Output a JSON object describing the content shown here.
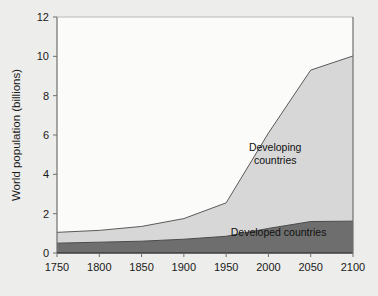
{
  "chart_data": {
    "type": "area",
    "title": "",
    "subtitle": "",
    "xlabel": "",
    "ylabel": "World population (billions)",
    "x": [
      1750,
      1800,
      1850,
      1900,
      1950,
      2000,
      2050,
      2100
    ],
    "xticklabels": [
      "1750",
      "1800",
      "1850",
      "1900",
      "1950",
      "2000",
      "2050",
      "2100"
    ],
    "yticklabels": [
      "0",
      "2",
      "4",
      "6",
      "8",
      "10",
      "12"
    ],
    "yticks": [
      0,
      2,
      4,
      6,
      8,
      10,
      12
    ],
    "xlim": [
      1750,
      2100
    ],
    "ylim": [
      0,
      12
    ],
    "grid": false,
    "stacked": true,
    "legend_position": "inline-annotations",
    "series": [
      {
        "name": "Developed countries",
        "color": "#6e6e6e",
        "values": [
          0.5,
          0.55,
          0.6,
          0.7,
          0.85,
          1.25,
          1.6,
          1.62
        ]
      },
      {
        "name": "Developing countries",
        "color": "#d7d7d7",
        "values": [
          0.55,
          0.6,
          0.75,
          1.05,
          1.7,
          4.85,
          7.7,
          8.4
        ]
      }
    ],
    "totals": [
      1.05,
      1.15,
      1.35,
      1.75,
      2.55,
      6.1,
      9.3,
      10.0
    ],
    "annotations": [
      {
        "name": "developing-label",
        "lines": [
          "Developing",
          "countries"
        ],
        "x": 2008,
        "y": 5.2
      },
      {
        "name": "developed-label",
        "lines": [
          "Developed countries"
        ],
        "x": 2012,
        "y": 0.85
      }
    ]
  },
  "colors": {
    "page_background": "#ededeb",
    "plot_background": "#fbfbfa",
    "axis": "#6f6f6f",
    "developed": "#6e6e6e",
    "developing": "#d7d7d7",
    "outline": "#5a5a5a",
    "text": "#1a1a1a"
  }
}
